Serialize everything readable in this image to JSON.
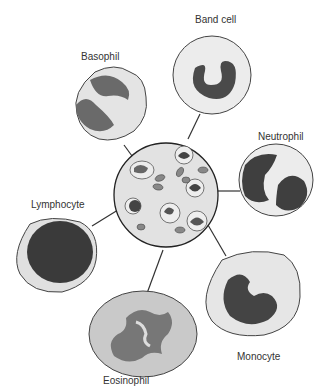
{
  "diagram": {
    "center": {
      "name": "Blood smear",
      "contents": [
        "red blood cells",
        "white blood cells"
      ]
    },
    "cells": [
      {
        "id": "band-cell",
        "label": "Band cell"
      },
      {
        "id": "basophil",
        "label": "Basophil"
      },
      {
        "id": "neutrophil",
        "label": "Neutrophil"
      },
      {
        "id": "lymphocyte",
        "label": "Lymphocyte"
      },
      {
        "id": "monocyte",
        "label": "Monocyte"
      },
      {
        "id": "eosinophil",
        "label": "Eosinophil"
      }
    ],
    "colors": {
      "background": "#ffffff",
      "center_fill": "#e2e2e2",
      "cytoplasm": "#e8e8e8",
      "nucleus": "#4a4a4a",
      "outline": "#333333",
      "rbc": "#777777"
    }
  }
}
